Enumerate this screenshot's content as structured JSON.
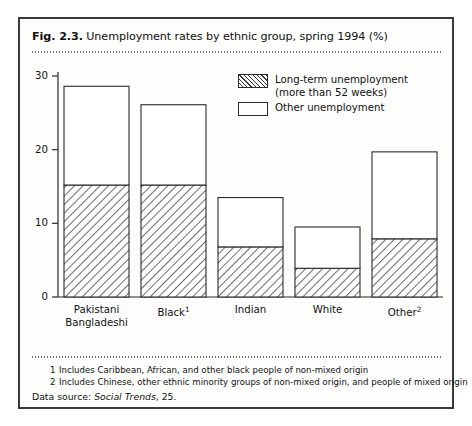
{
  "figure": {
    "number": "Fig. 2.3.",
    "title": "Unemployment rates by ethnic group, spring 1994 (%)"
  },
  "legend": {
    "items": [
      {
        "label_line1": "Long-term unemployment",
        "label_line2": "(more than 52 weeks)",
        "swatch": "hatched"
      },
      {
        "label_line1": "Other unemployment",
        "label_line2": "",
        "swatch": "empty"
      }
    ]
  },
  "footnotes": [
    {
      "marker": "1",
      "text": "Includes Caribbean, African, and other black people of non-mixed origin"
    },
    {
      "marker": "2",
      "text": "Includes Chinese, other ethnic minority groups of non-mixed origin, and people of mixed origin"
    }
  ],
  "data_source": {
    "prefix": "Data source:",
    "italic": "Social Trends",
    "suffix": ", 25."
  },
  "axis": {
    "y_ticks": [
      "0",
      "10",
      "20",
      "30"
    ],
    "x_labels": [
      {
        "line1": "Pakistani",
        "line2": "Bangladeshi",
        "sup": ""
      },
      {
        "line1": "Black",
        "line2": "",
        "sup": "1"
      },
      {
        "line1": "Indian",
        "line2": "",
        "sup": ""
      },
      {
        "line1": "White",
        "line2": "",
        "sup": ""
      },
      {
        "line1": "Other",
        "line2": "",
        "sup": "2"
      }
    ]
  },
  "chart_data": {
    "type": "bar",
    "stacked": true,
    "title": "Unemployment rates by ethnic group, spring 1994 (%)",
    "xlabel": "",
    "ylabel": "",
    "ylim": [
      0,
      30
    ],
    "yticks": [
      0,
      10,
      20,
      30
    ],
    "grid": false,
    "legend_position": "inside-top-right",
    "categories": [
      "Pakistani Bangladeshi",
      "Black",
      "Indian",
      "White",
      "Other"
    ],
    "series": [
      {
        "name": "Long-term unemployment (more than 52 weeks)",
        "fill": "hatched",
        "values": [
          15.2,
          15.2,
          6.8,
          3.9,
          7.9
        ]
      },
      {
        "name": "Other unemployment",
        "fill": "empty",
        "values": [
          13.4,
          10.9,
          6.7,
          5.6,
          11.8
        ]
      }
    ],
    "totals": [
      28.6,
      26.1,
      13.5,
      9.5,
      19.7
    ]
  },
  "colors": {
    "frame": "#3a3a3a",
    "bar_outline": "#2a2a2a",
    "hatch": "#3a3a3a",
    "background": "#fdfdfc",
    "text": "#111111"
  }
}
